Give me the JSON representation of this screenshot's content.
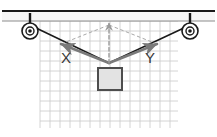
{
  "figure": {
    "type": "physics-free-body-diagram",
    "background_color": "#ffffff"
  },
  "ceiling": {
    "name": "ceiling-beam",
    "top_line_color": "#1a1a1a",
    "bottom_line_color": "#8c8c8c",
    "fill_color": "#f7f7f7",
    "x_start": 2,
    "x_end": 215,
    "y_top": 11,
    "y_bottom": 21
  },
  "grid": {
    "name": "background-grid",
    "line_color": "#c9c9c9",
    "x_start": 40,
    "x_end": 178,
    "y_start": 21,
    "y_end": 128,
    "cell_size": 10,
    "columns": 14,
    "rows": 11,
    "visible": true
  },
  "pulleys": [
    {
      "id": "left-pulley",
      "label": "left pulley",
      "cx": 30,
      "cy": 31,
      "outer_radius": 8,
      "inner_radius": 4,
      "hub_radius": 1.8,
      "stem_x": 30,
      "stem_top": 13,
      "stem_bottom": 28,
      "color": "#1a1a1a"
    },
    {
      "id": "right-pulley",
      "label": "right pulley",
      "cx": 190,
      "cy": 31,
      "outer_radius": 8,
      "inner_radius": 4,
      "hub_radius": 1.8,
      "stem_x": 190,
      "stem_top": 13,
      "stem_bottom": 28,
      "color": "#1a1a1a"
    }
  ],
  "ropes": [
    {
      "id": "left-rope",
      "label": "rope from left pulley to knot",
      "x1": 34,
      "y1": 27,
      "x2": 109,
      "y2": 63,
      "color": "#1a1a1a",
      "width": 1.6
    },
    {
      "id": "right-rope",
      "label": "rope from right pulley to knot",
      "x1": 186,
      "y1": 27,
      "x2": 109,
      "y2": 63,
      "color": "#1a1a1a",
      "width": 1.6
    }
  ],
  "knot": {
    "name": "knot-vertex",
    "x": 109,
    "y": 63,
    "description": "junction point where ropes and block meet"
  },
  "block": {
    "name": "suspended-block",
    "x": 98,
    "y": 68,
    "width": 24,
    "height": 22,
    "fill_color": "#e3e3e3",
    "stroke_color": "#4d4d4d",
    "stroke_width": 2
  },
  "vectors": [
    {
      "id": "vector-x",
      "label": "X",
      "label_x": 66,
      "label_y": 63,
      "from_x": 109,
      "from_y": 63,
      "to_x": 61,
      "to_y": 44,
      "color": "#7a7a7a",
      "width": 2.6,
      "style": "solid",
      "arrowhead": "at-tip",
      "description": "tension force vector pointing up-left"
    },
    {
      "id": "vector-y",
      "label": "Y",
      "label_x": 150,
      "label_y": 63,
      "from_x": 109,
      "from_y": 63,
      "to_x": 157,
      "to_y": 44,
      "color": "#7a7a7a",
      "width": 2.6,
      "style": "solid",
      "arrowhead": "at-tip",
      "description": "tension force vector pointing up-right"
    },
    {
      "id": "vector-resultant",
      "label": "",
      "from_x": 109,
      "from_y": 63,
      "to_x": 109,
      "to_y": 23,
      "color": "#9a9a9a",
      "width": 1.4,
      "style": "dashed",
      "arrowhead": "at-tip",
      "description": "dashed vertical resultant force arrow pointing up"
    }
  ],
  "construction_lines": [
    {
      "id": "parallelogram-left",
      "label": "dashed line from X tip to resultant tip",
      "x1": 61,
      "y1": 44,
      "x2": 109,
      "y2": 25,
      "color": "#a8a8a8",
      "width": 1,
      "style": "dashed"
    },
    {
      "id": "parallelogram-right",
      "label": "dashed line from Y tip to resultant tip",
      "x1": 157,
      "y1": 44,
      "x2": 109,
      "y2": 25,
      "color": "#a8a8a8",
      "width": 1,
      "style": "dashed"
    }
  ],
  "colors": {
    "ink": "#1a1a1a",
    "vector_gray": "#7a7a7a",
    "dashed_gray": "#a8a8a8",
    "grid_gray": "#c9c9c9",
    "block_fill": "#e3e3e3",
    "block_stroke": "#4d4d4d",
    "background": "#ffffff"
  }
}
